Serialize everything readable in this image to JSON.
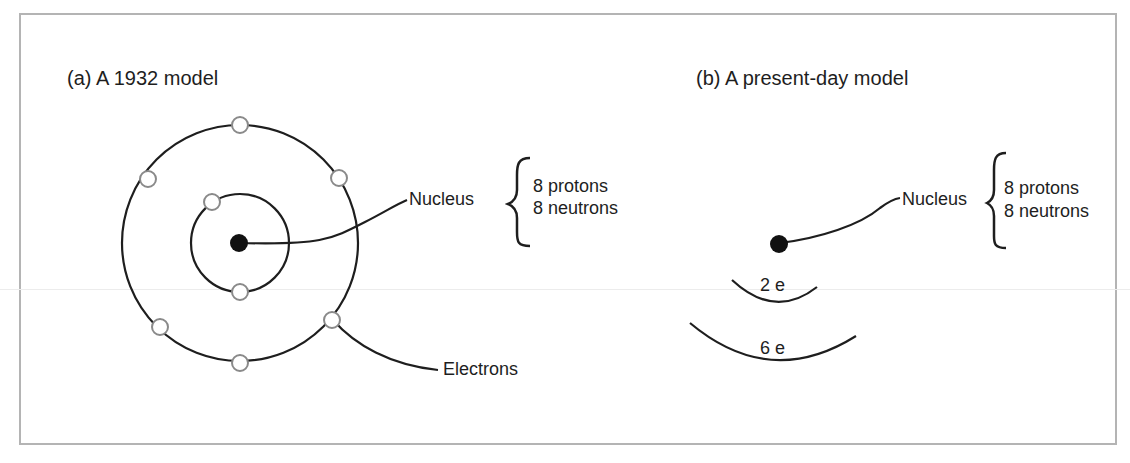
{
  "figure": {
    "panel_a": {
      "title": "(a)  A 1932 model",
      "nucleus_label": "Nucleus",
      "nucleus_composition": [
        "8 protons",
        "8 neutrons"
      ],
      "electrons_label": "Electrons",
      "inner_shell_electrons": 2,
      "outer_shell_electrons": 6
    },
    "panel_b": {
      "title": "(b)  A present-day model",
      "nucleus_label": "Nucleus",
      "nucleus_composition": [
        "8 protons",
        "8 neutrons"
      ],
      "shells": [
        {
          "label": "2 e"
        },
        {
          "label": "6 e"
        }
      ]
    },
    "colors": {
      "ink": "#1e1e1e",
      "electron_outline": "#8a8a8a",
      "frame": "#b4b4b4"
    }
  }
}
